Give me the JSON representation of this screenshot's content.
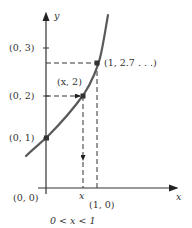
{
  "diagram": {
    "type": "exponential-function-graph",
    "axes": {
      "x_label": "x",
      "y_label": "y",
      "origin_label": "(0, 0)"
    },
    "y_ticks": [
      {
        "label": "(0, 3)",
        "value": 3
      },
      {
        "label": "(0, 2)",
        "value": 2
      },
      {
        "label": "(0, 1)",
        "value": 1
      }
    ],
    "x_ticks": [
      {
        "label": "x",
        "value": "x"
      },
      {
        "label": "(1, 0)",
        "value": 1
      }
    ],
    "points": [
      {
        "label": "(0, 1)",
        "x": 0,
        "y": 1
      },
      {
        "label": "(x, 2)",
        "x": "x",
        "y": 2
      },
      {
        "label": "(1, 2.7 . . .)",
        "x": 1,
        "y": 2.718
      }
    ],
    "caption": "0 < x < 1",
    "colors": {
      "curve": "#5a5a5a",
      "axes": "#333333",
      "text": "#333333"
    }
  }
}
